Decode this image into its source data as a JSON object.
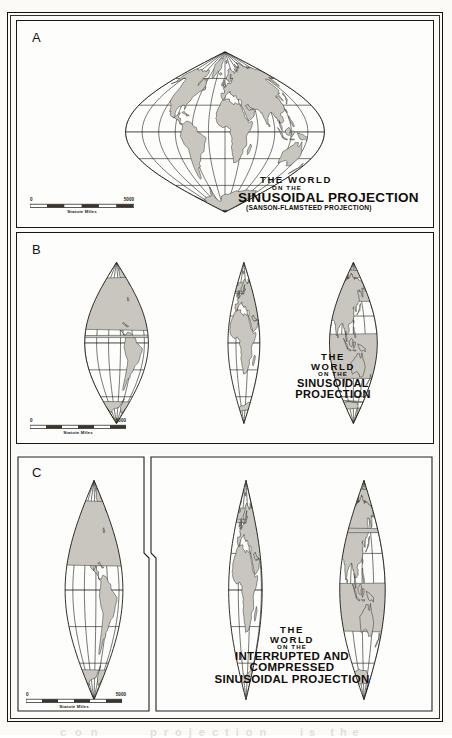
{
  "figure": {
    "background": "#fbfaf7",
    "land_fill": "#c9c6bf",
    "line_color": "#20201c"
  },
  "panels": [
    {
      "key": "A",
      "label": "A",
      "title": {
        "line1": "THE WORLD",
        "line2": "ON THE",
        "line3": "SINUSOIDAL PROJECTION",
        "line4": "(SANSON-FLAMSTEED PROJECTION)"
      },
      "scale": {
        "zero": "0",
        "max": "5000",
        "caption": "Statute Miles"
      },
      "lobes": 1,
      "description": "Uninterrupted sinusoidal projection of the world, central meridian 0 degrees"
    },
    {
      "key": "B",
      "label": "B",
      "title": {
        "line1": "THE",
        "line2": "WORLD",
        "line3": "ON THE",
        "line4": "SINUSOIDAL",
        "line5": "PROJECTION"
      },
      "scale": {
        "zero": "0",
        "max": "5000",
        "caption": "Statute Miles"
      },
      "lobes": 3,
      "description": "Interrupted sinusoidal projection in three lobes: Americas, Africa-Europe, Asia-Australia"
    },
    {
      "key": "C",
      "label": "C",
      "title": {
        "line1": "THE",
        "line2": "WORLD",
        "line3": "ON THE",
        "line4": "INTERRUPTED AND",
        "line5": "COMPRESSED",
        "line6": "SINUSOIDAL PROJECTION"
      },
      "scale": {
        "zero": "0",
        "max": "5000",
        "caption": "Statute Miles"
      },
      "lobes": 3,
      "description": "Interrupted and compressed sinusoidal projection; New World set in its own inset frame at left, Old World in two lobes at right"
    }
  ],
  "graticule": {
    "parallel_interval_deg": 30,
    "meridian_interval_deg": 30,
    "equator_shown": true
  },
  "ghost_text": [
    "Geographic",
    "PROJECTION",
    "sinusoidal",
    "of the",
    "the world",
    "COMP",
    "con",
    "projection",
    "is the",
    "EQUAL",
    "AREA"
  ]
}
